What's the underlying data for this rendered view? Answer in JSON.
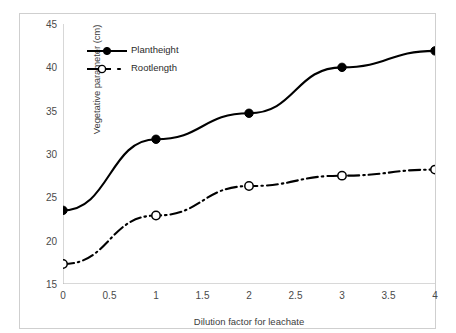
{
  "chart_data": {
    "type": "line",
    "title": "",
    "xlabel": "Dilution factor for leachate",
    "ylabel": "Vegetative parameter (cm)",
    "xlim": [
      0,
      4
    ],
    "ylim": [
      15,
      45
    ],
    "xticks": [
      "0",
      "0.5",
      "1",
      "1.5",
      "2",
      "2.5",
      "3",
      "3.5",
      "4"
    ],
    "yticks": [
      "15",
      "20",
      "25",
      "30",
      "35",
      "40",
      "45"
    ],
    "grid": false,
    "legend_position": "upper-left-inside",
    "x": [
      0,
      1,
      2,
      3,
      4
    ],
    "series": [
      {
        "name": "Plantheight",
        "values": [
          23.5,
          31.7,
          34.7,
          40.0,
          41.9
        ],
        "line_style": "solid",
        "marker": "filled-circle",
        "color": "#000000"
      },
      {
        "name": "Rootlength",
        "values": [
          17.3,
          22.9,
          26.3,
          27.5,
          28.2
        ],
        "line_style": "dash-dot",
        "marker": "open-circle",
        "color": "#000000"
      }
    ]
  },
  "legend": {
    "items": [
      {
        "label": "Plantheight"
      },
      {
        "label": "Rootlength"
      }
    ]
  },
  "axes": {
    "y_title": "Vegetative parameter (cm)",
    "x_title": "Dilution factor for leachate"
  },
  "colors": {
    "line": "#000000",
    "frame": "#cfcfcf",
    "axis": "#b5b5b5",
    "text": "#3d3d3d"
  }
}
